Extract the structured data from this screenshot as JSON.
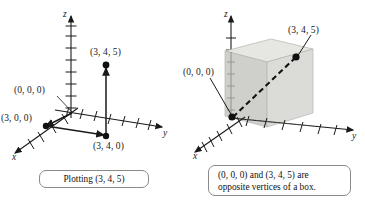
{
  "figure": {
    "type": "math-illustration",
    "background_color": "#ffffff",
    "ink_color": "#1a1a1a"
  },
  "panels": [
    {
      "id": "left",
      "caption": "Plotting (3, 4, 5)",
      "axes": [
        {
          "name": "z-axis",
          "label": "z",
          "ticks": 8
        },
        {
          "name": "y-axis",
          "label": "y",
          "ticks": 7
        },
        {
          "name": "x-axis",
          "label": "x",
          "ticks": 4
        }
      ],
      "points": [
        {
          "name": "origin",
          "label": "(0, 0, 0)"
        },
        {
          "name": "point-x",
          "label": "(3, 0, 0)"
        },
        {
          "name": "point-xy",
          "label": "(3, 4, 0)"
        },
        {
          "name": "point-xyz",
          "label": "(3, 4, 5)"
        }
      ]
    },
    {
      "id": "right",
      "caption_line_1": "(0, 0, 0) and (3, 4, 5) are",
      "caption_line_2": "opposite vertices of a box.",
      "axes": [
        {
          "name": "z-axis",
          "label": "z",
          "ticks": 7
        },
        {
          "name": "y-axis",
          "label": "y",
          "ticks": 6
        },
        {
          "name": "x-axis",
          "label": "x",
          "ticks": 5
        }
      ],
      "points": [
        {
          "name": "origin",
          "label": "(0, 0, 0)"
        },
        {
          "name": "point-xyz",
          "label": "(3, 4, 5)"
        }
      ],
      "box": {
        "name": "rectangular-box",
        "top_face_color": "#e3e3e1",
        "left_face_color": "#c9c9c6",
        "front_face_color": "#d6d6d3",
        "edge_color": "#9a9a97"
      }
    }
  ]
}
